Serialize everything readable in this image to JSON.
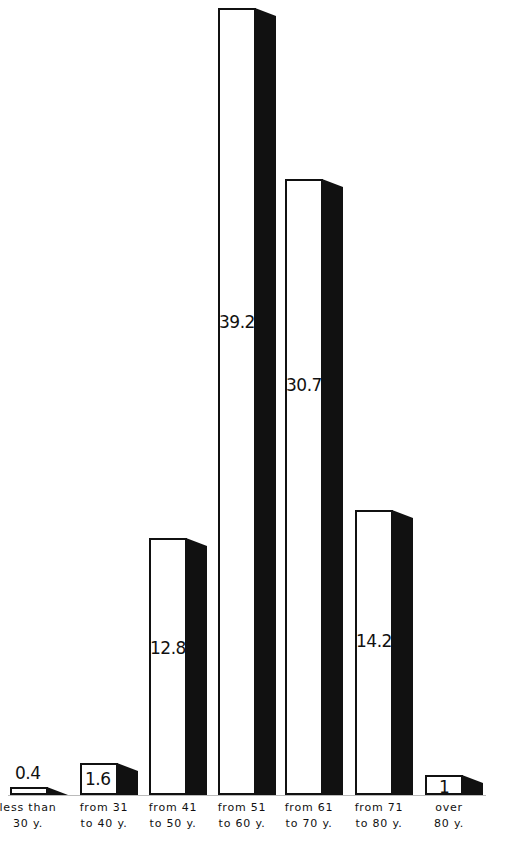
{
  "chart_data": {
    "type": "bar",
    "title": "",
    "xlabel": "",
    "ylabel": "",
    "style": "3d-bars-white-front-black-side",
    "grid": false,
    "legend": null,
    "categories": [
      "less than 30 y.",
      "from 31 to 40 y.",
      "from 41 to 50 y.",
      "from 51 to 60 y.",
      "from 61 to 70 y.",
      "from 71 to 80 y.",
      "over 80 y."
    ],
    "category_lines": [
      [
        "less than",
        "30 y."
      ],
      [
        "from 31",
        "to 40 y."
      ],
      [
        "from 41",
        "to 50 y."
      ],
      [
        "from 51",
        "to 60 y."
      ],
      [
        "from 61",
        "to 70 y."
      ],
      [
        "from 71",
        "to 80 y."
      ],
      [
        "over",
        "80 y."
      ]
    ],
    "values": [
      0.4,
      1.6,
      12.8,
      39.2,
      30.7,
      14.2,
      1
    ],
    "value_labels": [
      "0.4",
      "1.6",
      "12.8",
      "39.2",
      "30.7",
      "14.2",
      "1"
    ],
    "ylim": [
      0,
      40
    ],
    "colors": {
      "front": "#ffffff",
      "side": "#111111",
      "outline": "#111111"
    }
  }
}
